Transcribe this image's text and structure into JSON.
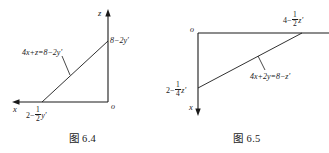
{
  "figures": [
    {
      "id": "fig-6-4",
      "caption": "图 6.4",
      "axes": {
        "horizontal_label": "x",
        "vertical_label": "z",
        "origin_label": "o",
        "horizontal_direction": "left",
        "vertical_direction": "up"
      },
      "labels": {
        "equation_prefix": "4x+z=8−2y",
        "equation_prime": "′",
        "z_intercept_prefix": "8−2y",
        "z_intercept_prime": "′",
        "x_intercept_lead": "2−",
        "x_intercept_num": "1",
        "x_intercept_den": "2",
        "x_intercept_tail": "y",
        "x_intercept_prime": "′"
      }
    },
    {
      "id": "fig-6-5",
      "caption": "图 6.5",
      "axes": {
        "horizontal_label": "",
        "vertical_label": "x",
        "origin_label": "o",
        "horizontal_direction": "right",
        "vertical_direction": "down"
      },
      "labels": {
        "equation_prefix": "4x+2y=8−z",
        "equation_prime": "′",
        "top_intercept_lead": "4−",
        "top_intercept_num": "1",
        "top_intercept_den": "2",
        "top_intercept_tail": "z",
        "top_intercept_prime": "′",
        "left_intercept_lead": "2−",
        "left_intercept_num": "1",
        "left_intercept_den": "4",
        "left_intercept_tail": "z",
        "left_intercept_prime": "′"
      }
    }
  ],
  "style": {
    "line_color": "#1a1a1a",
    "background": "#ffffff"
  }
}
